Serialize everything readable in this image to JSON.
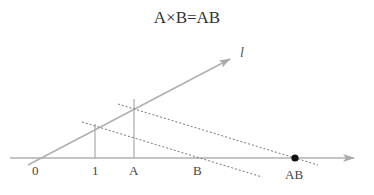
{
  "title": "A×B=AB",
  "labels": {
    "origin": "0",
    "one": "1",
    "a": "A",
    "b": "B",
    "ab": "AB",
    "line_l": "l"
  },
  "colors": {
    "line": "#aaaaaa",
    "dashed": "#777777",
    "point": "#111111",
    "text": "#444444"
  }
}
